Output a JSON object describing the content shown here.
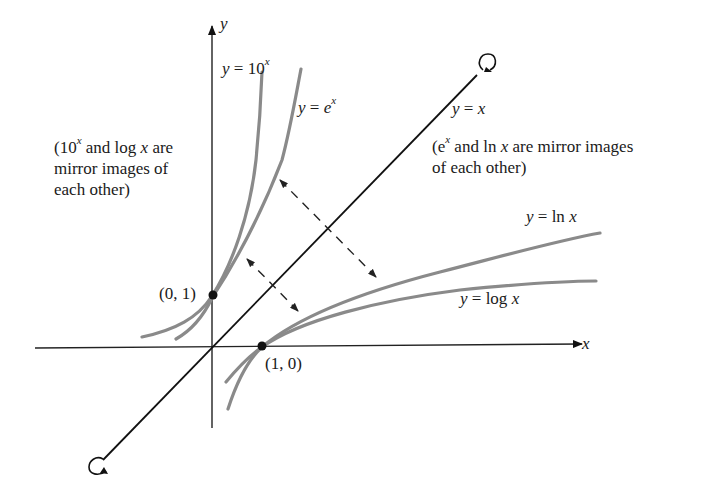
{
  "diagram": {
    "type": "function-graph",
    "axes": {
      "x_label": "x",
      "y_label": "y"
    },
    "curves": [
      {
        "id": "ten-pow-x",
        "label_lhs": "y =",
        "label_rhs": "10",
        "label_sup": "x",
        "color": "#808080"
      },
      {
        "id": "exp-x",
        "label_lhs": "y =",
        "label_rhs": "e",
        "label_sup": "x",
        "color": "#808080"
      },
      {
        "id": "ln-x",
        "label_lhs": "y =",
        "label_rhs": "ln",
        "label_var": "x",
        "color": "#808080"
      },
      {
        "id": "log-x",
        "label_lhs": "y =",
        "label_rhs": "log",
        "label_var": "x",
        "color": "#808080"
      },
      {
        "id": "identity",
        "label_lhs": "y =",
        "label_var": "x",
        "color": "#111111"
      }
    ],
    "points": [
      {
        "label": "(0, 1)"
      },
      {
        "label": "(1, 0)"
      }
    ],
    "notes": {
      "left": {
        "open": "(10",
        "sup": "x",
        "mid": " and log ",
        "var": "x",
        "line1_end": " are",
        "line2": "mirror images of",
        "line3": "each other)"
      },
      "right": {
        "open": "(e",
        "sup": "x",
        "mid": " and ln ",
        "var": "x",
        "line1_end": " are mirror images",
        "line2": "of each other)"
      }
    }
  }
}
